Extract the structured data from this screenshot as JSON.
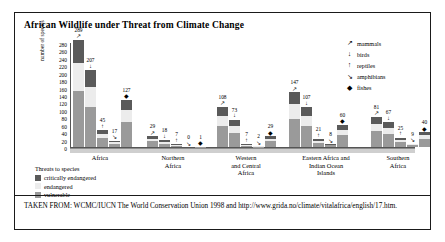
{
  "title": "African Wildlife under Threat from Climate Change",
  "footer": "TAKEN FROM: WCMC/IUCN The World Conservation Union 1998 and http://www.grida.no/climate/vitalafrica/english/17.htm.",
  "fauna_legend": {
    "items": [
      {
        "icon": "↗",
        "label": "mammals",
        "name": "mammal-icon"
      },
      {
        "icon": "↓",
        "label": "birds",
        "name": "bird-icon"
      },
      {
        "icon": "↑",
        "label": "reptiles",
        "name": "reptile-icon"
      },
      {
        "icon": "↘",
        "label": "amphibians",
        "name": "amphibian-icon"
      },
      {
        "icon": "◆",
        "label": "fishes",
        "name": "fish-icon"
      }
    ]
  },
  "threat_legend": {
    "title": "Threats to species",
    "items": [
      {
        "label": "critically endangered",
        "color": "#5a5a5a"
      },
      {
        "label": "endangered",
        "color": "#ececec"
      },
      {
        "label": "vulnerable",
        "color": "#9a9a9a"
      }
    ]
  },
  "chart_data": {
    "type": "bar",
    "subtype": "grouped-stacked",
    "title": "African Wildlife under Threat from Climate Change",
    "xlabel": "",
    "ylabel": "number of species",
    "ylim": [
      0,
      280
    ],
    "ytick_step": 20,
    "yticks": [
      280,
      260,
      240,
      220,
      200,
      180,
      160,
      140,
      120,
      100,
      80,
      60,
      40,
      20,
      0
    ],
    "grid": false,
    "legend_position": "right",
    "categories": [
      "Africa",
      "Northern Africa",
      "Western and Central Africa",
      "Eastern Africa and Indian Ocean Islands",
      "Southern Africa"
    ],
    "category_lines": [
      [
        "Africa"
      ],
      [
        "Northern",
        "Africa"
      ],
      [
        "Western",
        "and Central",
        "Africa"
      ],
      [
        "Eastern Africa and",
        "Indian Ocean",
        "Islands"
      ],
      [
        "Southern",
        "Africa"
      ]
    ],
    "groups": [
      "mammals",
      "birds",
      "reptiles",
      "amphibians",
      "fishes"
    ],
    "stack_levels": [
      "critically endangered",
      "endangered",
      "vulnerable"
    ],
    "series": [
      {
        "name": "mammals",
        "values": [
          289,
          29,
          108,
          147,
          81
        ]
      },
      {
        "name": "birds",
        "values": [
          207,
          18,
          73,
          107,
          67
        ]
      },
      {
        "name": "reptiles",
        "values": [
          45,
          7,
          7,
          21,
          25
        ]
      },
      {
        "name": "amphibians",
        "values": [
          17,
          0,
          2,
          8,
          9
        ]
      },
      {
        "name": "fishes",
        "values": [
          127,
          1,
          29,
          60,
          40
        ]
      }
    ]
  }
}
